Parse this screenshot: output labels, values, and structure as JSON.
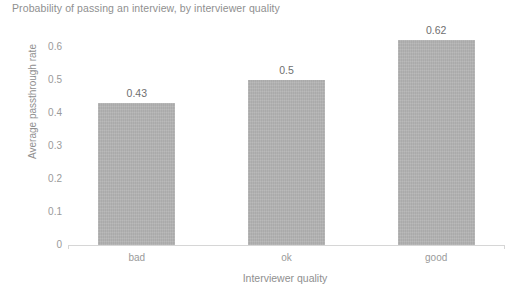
{
  "chart_data": {
    "type": "bar",
    "title": "Probability of passing an interview, by interviewer quality",
    "xlabel": "Interviewer quality",
    "ylabel": "Average passthrough rate",
    "categories": [
      "bad",
      "ok",
      "good"
    ],
    "values": [
      0.43,
      0.5,
      0.62
    ],
    "value_labels": [
      "0.43",
      "0.5",
      "0.62"
    ],
    "ylim": [
      0,
      0.65
    ],
    "y_ticks": [
      0,
      0.1,
      0.2,
      0.3,
      0.4,
      0.5,
      0.6
    ],
    "y_tick_labels": [
      "0",
      "0.1",
      "0.2",
      "0.3",
      "0.4",
      "0.5",
      "0.6"
    ],
    "grid": false,
    "legend": false,
    "bar_color": "#b2b2b2",
    "text_color": "#8f8f8f",
    "axis_color": "#d6d6d6",
    "background_color": "#ffffff"
  }
}
